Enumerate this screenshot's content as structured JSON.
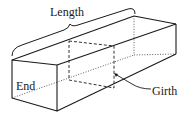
{
  "diagram": {
    "type": "rectangular-prism",
    "labels": {
      "length": "Length",
      "end": "End",
      "girth": "Girth"
    },
    "colors": {
      "stroke": "#1a1a1a",
      "background": "#ffffff"
    }
  }
}
